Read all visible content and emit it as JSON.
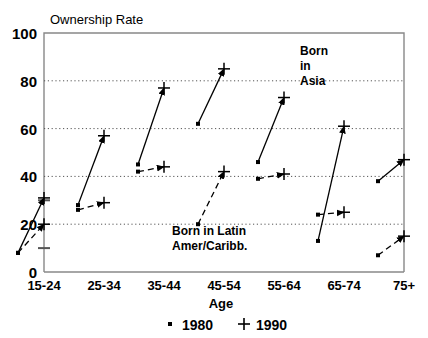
{
  "chart_data": {
    "type": "line",
    "title": "Ownership Rate",
    "xlabel": "Age",
    "ylabel": "Ownership Rate",
    "categories": [
      "15-24",
      "25-34",
      "35-44",
      "45-54",
      "55-64",
      "65-74",
      "75+"
    ],
    "ylim": [
      0,
      100
    ],
    "yticks": [
      0,
      20,
      40,
      60,
      80,
      100
    ],
    "ytick_labels": [
      "0",
      "20",
      "40",
      "60",
      "80",
      "100"
    ],
    "grid": "horizontal-dotted",
    "legend": {
      "position": "below-axis",
      "entries": [
        {
          "label": "1980",
          "marker": "dot"
        },
        {
          "label": "1990",
          "marker": "plus"
        }
      ]
    },
    "annotations": [
      {
        "text": "Born\nin\nAsia",
        "lines": [
          "Born",
          "in",
          "Asia"
        ],
        "x": 300,
        "y": 55
      },
      {
        "text": "Born in Latin\nAmer/Caribb.",
        "lines": [
          "Born in Latin",
          "Amer/Caribb."
        ],
        "x": 172,
        "y": 235
      }
    ],
    "series": [
      {
        "name": "Born in Asia",
        "line_style": "solid",
        "values_1980": [
          8,
          28,
          45,
          62,
          46,
          13,
          38
        ],
        "values_1990": [
          31,
          57,
          77,
          85,
          73,
          61,
          47
        ]
      },
      {
        "name": "Born in Latin Amer/Caribb.",
        "line_style": "dashed",
        "values_1980": [
          8,
          26,
          42,
          20,
          39,
          24,
          7
        ],
        "values_1990": [
          20,
          29,
          44,
          42,
          41,
          25,
          15
        ]
      }
    ]
  }
}
